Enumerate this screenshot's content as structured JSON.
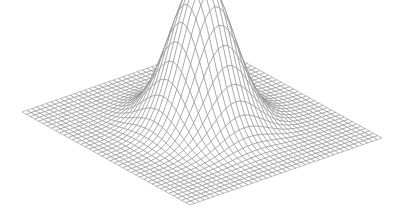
{
  "chart_data": {
    "type": "surface-wireframe",
    "title": "",
    "function": "gaussian",
    "grid_lines": 40,
    "x_range": [
      -3,
      3
    ],
    "y_range": [
      -3,
      3
    ],
    "sigma": 0.75,
    "peak_value": 1.0,
    "xlabel": "",
    "ylabel": "",
    "zlabel": "",
    "axes_visible": false,
    "line_color": "#8a8a8a",
    "background": "#ffffff"
  },
  "projection": {
    "left_corner": [
      22,
      112
    ],
    "front_corner": [
      190,
      205
    ],
    "right_corner": [
      382,
      138
    ],
    "peak_height_px": 150
  }
}
